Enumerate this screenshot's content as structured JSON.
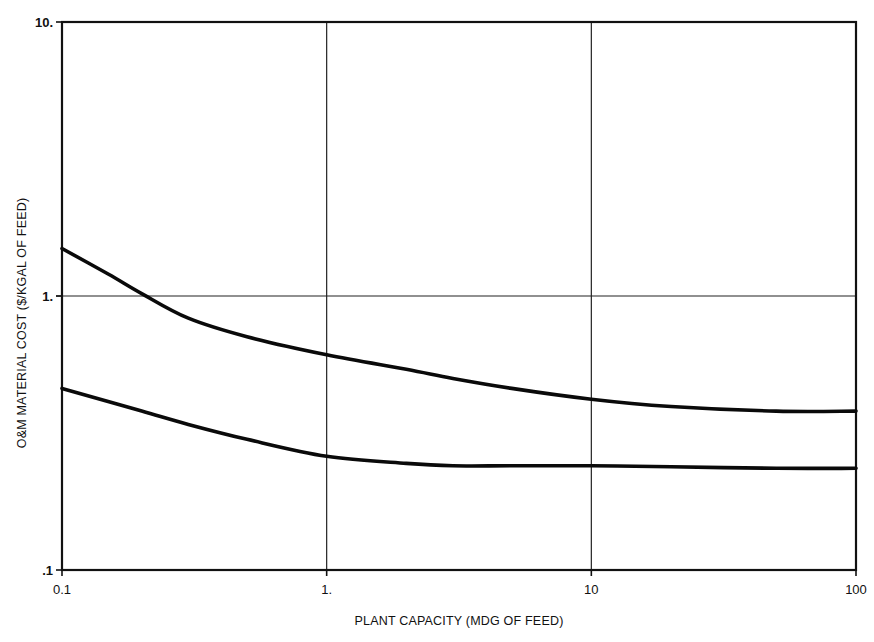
{
  "chart_data": {
    "type": "line",
    "title": "",
    "xlabel": "PLANT CAPACITY (MDG OF FEED)",
    "ylabel": "O&M MATERIAL COST ($/KGAL OF FEED)",
    "xscale": "log",
    "yscale": "log",
    "xlim": [
      0.1,
      100
    ],
    "ylim": [
      0.1,
      10
    ],
    "x_tick_labels": [
      "0.1",
      "1.",
      "10",
      "100"
    ],
    "x_ticks": [
      0.1,
      1,
      10,
      100
    ],
    "y_tick_labels": [
      ".1",
      "1.",
      "10."
    ],
    "y_ticks": [
      0.1,
      1,
      10
    ],
    "grid": true,
    "legend": null,
    "series": [
      {
        "name": "Upper curve",
        "x": [
          0.1,
          0.15,
          0.2,
          0.3,
          0.5,
          1,
          2,
          3,
          5,
          10,
          20,
          50,
          100
        ],
        "y": [
          1.49,
          1.2,
          1.02,
          0.83,
          0.71,
          0.61,
          0.54,
          0.5,
          0.46,
          0.42,
          0.395,
          0.38,
          0.38
        ]
      },
      {
        "name": "Lower curve",
        "x": [
          0.1,
          0.2,
          0.3,
          0.5,
          1,
          2,
          3,
          5,
          10,
          20,
          50,
          100
        ],
        "y": [
          0.46,
          0.38,
          0.34,
          0.3,
          0.26,
          0.245,
          0.24,
          0.24,
          0.24,
          0.238,
          0.235,
          0.235
        ]
      }
    ]
  }
}
